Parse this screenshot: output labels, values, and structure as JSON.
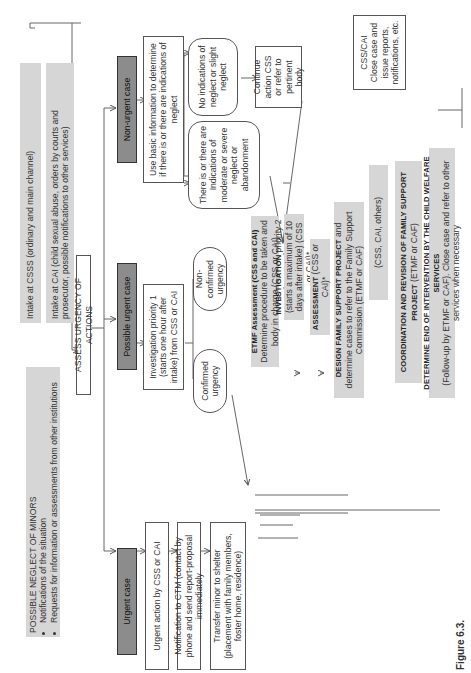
{
  "figure": {
    "caption": "Figure 6.3.",
    "orientation": "rotated 90 degrees counter-clockwise"
  },
  "start": {
    "title": "POSSIBLE NEGLECT OF MINORS",
    "bullets": [
      "Notifications of the situation",
      "Requests for information or assessments from other institutions"
    ]
  },
  "intake": {
    "csss": "Intake at CSSS (ordinary and main channel)",
    "cai": "Intake at CAI (child sexual abuse, orders by courts and prosecutor, possible notifications to other services)"
  },
  "assess": "ASSESS URGENCY OF ACTIONS",
  "branches": {
    "urgent": "Urgent case",
    "possible_urgent": "Possible urgent case",
    "non_urgent": "Non-urgent case"
  },
  "urgent_path": {
    "action": "Urgent action by CSS or CAI",
    "notification": "Notification to CTM (contact by phone and send report-proposal immediately",
    "transfer": "Transfer minor to shelter (placement with family members, foster home, residence)"
  },
  "possible_path": {
    "investigation": "Investigation priority 1 (starts one hour after intake) from CSS or CAI",
    "confirmed": "Confirmed urgency",
    "non_confirmed": "Non-confirmed urgency"
  },
  "non_urgent_path": {
    "basic_info": "Use basic information to determine if there is or there are indications of neglect",
    "indications": "There is or there are Indications of moderate or severe neglect or abandonment",
    "no_indications": "No indications of neglect or slight neglect",
    "continue": "Continue action CSS or refer to pertinent body"
  },
  "main_flow": {
    "etmf_title": "ETMF Assessment (CSS and CAI)",
    "etmf_body": "Determine procedure to be taken and body in charge (CSS or CAI)",
    "investigation_title": "INVESTIGATION",
    "investigation_body": "priority 2 (starts a maximum of 10 days after intake) (CSS or CAI)*",
    "assessment_title": "ASSESSMENT",
    "assessment_body": "(CSS or CAI)*",
    "design_title": "DESIGN FAMILY SUPPORT PROJECT",
    "design_body": "and determine cases to refer to the Family Support Commission (ETMF or CAF)",
    "agencies": "(CSS, CAI, others)",
    "coordination_title": "COORDINATION AND REVISION OF FAMILY SUPPORT PROJECT",
    "coordination_body": "(ETMF or CAF)",
    "end_title": "DETERMINE END OF INTERVENTION BY THE CHILD WELFARE SERVICES",
    "end_body": "(Follow-up by ETMF or CAF). Close case and refer to other services when necessary"
  },
  "closure": {
    "title": "CSS/CAI",
    "body": "Close case and issue reports, notifications, etc."
  },
  "colors": {
    "grey_box": "#d6d6d6",
    "dark_box": "#8c8c8c",
    "line": "#555555"
  }
}
